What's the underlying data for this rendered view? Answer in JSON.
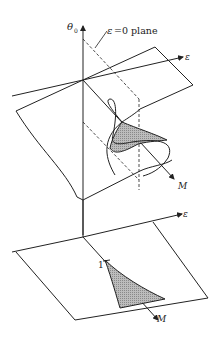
{
  "figure": {
    "labels": {
      "theta_axis": "θ",
      "theta_sub": "0",
      "plane_label_eps": "ε",
      "plane_label_rest": "=0 plane",
      "eps_axis_upper": "ε",
      "eps_axis_lower": "ε",
      "m_upper": "M",
      "m_lower": "M",
      "one_mark": "1"
    },
    "colors": {
      "stroke": "#222222",
      "shade": "#aaaaaa",
      "background": "#ffffff"
    }
  }
}
